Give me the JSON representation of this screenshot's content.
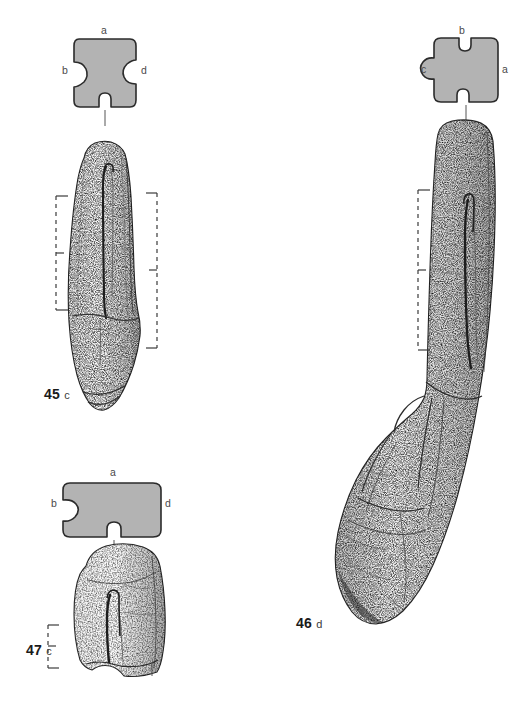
{
  "plate": {
    "title": "Archaeological artefact illustration plate",
    "background_color": "#ffffff",
    "ink_color": "#1a1a1a",
    "section_fill_color": "#b3b3b3",
    "section_outline_color": "#2b2b2b",
    "label_color": "#4a4a4a",
    "width": 529,
    "height": 716
  },
  "figures": [
    {
      "id": "figure-45",
      "number": "45",
      "view_letter": "c",
      "caption": "45 c",
      "cross_section": {
        "name": "cross-section-45",
        "shape": "notched-rectangle-tall",
        "labels": {
          "top": "a",
          "left": "b",
          "right": "d",
          "bottom_tick": "l"
        }
      },
      "scale_brackets": [
        {
          "name": "bracket-45-left",
          "orientation": "left",
          "style": "dashed"
        },
        {
          "name": "bracket-45-right",
          "orientation": "right",
          "style": "dashed"
        }
      ]
    },
    {
      "id": "figure-46",
      "number": "46",
      "view_letter": "d",
      "caption": "46 d",
      "cross_section": {
        "name": "cross-section-46",
        "shape": "notched-square",
        "labels": {
          "top": "b",
          "left": "c",
          "right": "a",
          "bottom_tick": "l"
        }
      },
      "scale_brackets": [
        {
          "name": "bracket-46-left",
          "orientation": "left",
          "style": "dashed"
        }
      ]
    },
    {
      "id": "figure-47",
      "number": "47",
      "view_letter": "c",
      "caption": "47 c",
      "cross_section": {
        "name": "cross-section-47",
        "shape": "notched-rectangle-wide",
        "labels": {
          "top": "a",
          "left": "b",
          "right": "d",
          "bottom_tick": "l"
        }
      },
      "scale_brackets": [
        {
          "name": "bracket-47-left",
          "orientation": "left",
          "style": "dashed"
        }
      ]
    }
  ],
  "labels": {
    "fig45": {
      "a": "a",
      "b": "b",
      "d": "d"
    },
    "fig46": {
      "b": "b",
      "c": "c",
      "a": "a"
    },
    "fig47": {
      "a": "a",
      "b": "b",
      "d": "d"
    }
  },
  "captions": {
    "fig45_num": "45",
    "fig45_sub": "c",
    "fig46_num": "46",
    "fig46_sub": "d",
    "fig47_num": "47",
    "fig47_sub": "c"
  }
}
